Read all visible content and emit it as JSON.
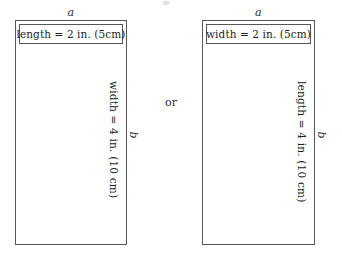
{
  "diagram": {
    "connector_label": "or",
    "stroke_color": "#55555c",
    "text_color": "#1d1d1d",
    "background_color": "#ffffff",
    "artifacts": {
      "top_speck": "scan-speck"
    },
    "figures": [
      {
        "id": "left-rectangle",
        "top_label": "a",
        "side_label": "b",
        "horizontal_caption": "length = 2 in. (5cm)",
        "vertical_caption": "width = 4 in. (10 cm)"
      },
      {
        "id": "right-rectangle",
        "top_label": "a",
        "side_label": "b",
        "horizontal_caption": "width = 2 in. (5cm)",
        "vertical_caption": "length = 4 in. (10 cm)"
      }
    ]
  }
}
